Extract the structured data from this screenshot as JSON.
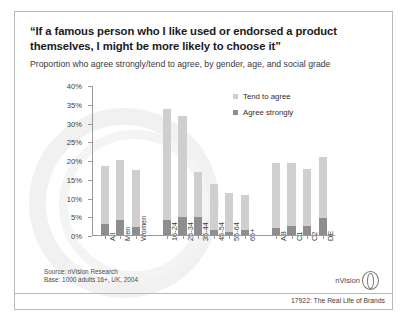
{
  "slide": {
    "title": "“If a famous person who I like used or endorsed a product themselves, I might be more likely to choose it”",
    "subtitle": "Proportion who agree strongly/tend to agree, by gender, age, and social grade",
    "source_line1": "Source: nVision Research",
    "source_line2": "Base: 1000 adults 16+, UK, 2004",
    "logo_text": "nVision",
    "caption": "17922: The Real Life of Brands"
  },
  "chart_data": {
    "type": "bar",
    "stacked": true,
    "title": "",
    "xlabel": "",
    "ylabel": "",
    "ylim": [
      0,
      40
    ],
    "ytick_labels": [
      "0%",
      "5%",
      "10%",
      "15%",
      "20%",
      "25%",
      "30%",
      "35%",
      "40%"
    ],
    "ytick_values": [
      0,
      5,
      10,
      15,
      20,
      25,
      30,
      35,
      40
    ],
    "grid": false,
    "legend_position": "top-right",
    "categories": [
      "All",
      "Men",
      "Women",
      "16-24",
      "25-34",
      "35-44",
      "45-54",
      "55-64",
      "65+",
      "AB",
      "C1",
      "C2",
      "DE"
    ],
    "group_gaps_after": [
      "Women",
      "65+"
    ],
    "series": [
      {
        "name": "Agree strongly",
        "color": "#8e8e8e",
        "values": [
          3.3,
          4.3,
          2.5,
          4.4,
          5.0,
          5.2,
          1.6,
          1.2,
          1.5,
          2.2,
          2.7,
          2.7,
          4.7
        ]
      },
      {
        "name": "Tend to agree",
        "color": "#cfcfcf",
        "values": [
          15.5,
          15.9,
          15.2,
          29.6,
          27.0,
          11.8,
          12.4,
          10.3,
          9.5,
          17.3,
          16.8,
          15.3,
          16.3
        ]
      }
    ],
    "totals": [
      18.8,
      20.2,
      17.7,
      34.0,
      32.0,
      17.0,
      14.0,
      11.5,
      11.0,
      19.5,
      19.5,
      18.0,
      21.0
    ]
  }
}
